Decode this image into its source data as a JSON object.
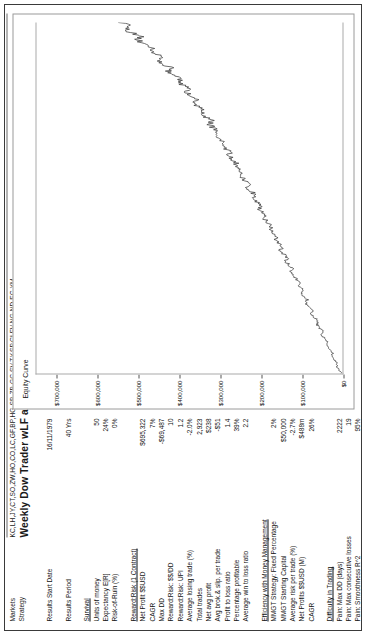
{
  "header": {
    "markets_label": "Markets",
    "markets_value": "KC,LH,JY,CT,SO,ZW,HO,CO,LC,GF,BP,HG,SB,ZB,GC,SV,TY,SP,CLFV,NG,ND,EC,YM",
    "strategy_label": "Strategy",
    "strategy_value": "Weekly Dow Trader wLF and Daily 2 Stop Trade Plan",
    "results_start_date_label": "Results Start Date",
    "results_start_date_value": "16/11/1979",
    "results_period_label": "Results Period",
    "results_period_value": "40 Yrs"
  },
  "metrics": {
    "sections": [
      {
        "title": "Survival",
        "rows": [
          {
            "label": "Units of money",
            "value": "50"
          },
          {
            "label": "Expectancy E[R]",
            "value": "24%"
          },
          {
            "label": "Risk-of-Ruin (%)",
            "value": "0%"
          }
        ]
      },
      {
        "title": "Reward:Risk (1 Contract)",
        "rows": [
          {
            "label": "Net Profit $$USD",
            "value": "$695,322"
          },
          {
            "label": "CAGR",
            "value": "7%"
          },
          {
            "label": "Max DD",
            "value": "-$69,487"
          },
          {
            "label": "Reward:Risk: $$/DD",
            "value": "10"
          },
          {
            "label": "Reward:Risk: UPI",
            "value": "1.2"
          },
          {
            "label": "Average losing trade (%)",
            "value": "-2.0%"
          },
          {
            "label": "Total trades",
            "value": "2,923"
          },
          {
            "label": "Net avg profit",
            "value": "$238"
          },
          {
            "label": "Avg brok.& slip. per trade",
            "value": "-$51"
          },
          {
            "label": "Profit to loss ratio",
            "value": "1.4"
          },
          {
            "label": "Percentage profitable",
            "value": "39%"
          },
          {
            "label": "Average win to loss ratio",
            "value": "2.2"
          }
        ]
      },
      {
        "title": "Efficiency with Money Management",
        "rows": [
          {
            "label": "MMGT Strategy: Fixed Percentage",
            "value": "2%"
          },
          {
            "label": "MMGT Starting Capital",
            "value": "$50,000"
          },
          {
            "label": "Average risk per trade (%)",
            "value": "-2.7%"
          },
          {
            "label": "Net Profits $$USD (M)",
            "value": "$488m"
          },
          {
            "label": "CAGR",
            "value": "26%"
          }
        ]
      },
      {
        "title": "Difficulty in Trading",
        "rows": [
          {
            "label": "Pain: Max DD (days)",
            "value": "2222"
          },
          {
            "label": "Pain: Max consecutive losses",
            "value": "19"
          },
          {
            "label": "Pain: Smoothness R^2",
            "value": "95%"
          }
        ]
      }
    ]
  },
  "chart_data": {
    "type": "line",
    "title": "Equity Curve",
    "xlabel": "",
    "ylabel": "",
    "grid": false,
    "legend": "none",
    "ylim": [
      0,
      750000
    ],
    "ytick_labels": [
      "$700,000",
      "$600,000",
      "$500,000",
      "$400,000",
      "$300,000",
      "$200,000",
      "$100,000",
      "$0"
    ],
    "ytick_values": [
      700000,
      600000,
      500000,
      400000,
      300000,
      200000,
      100000,
      0
    ],
    "series": [
      {
        "name": "Equity Curve",
        "x": [
          0,
          1,
          2,
          3,
          4,
          5,
          6,
          7,
          8,
          9,
          10,
          11,
          12,
          13,
          14,
          15,
          16,
          17,
          18,
          19,
          20,
          21,
          22,
          23,
          24,
          25,
          26,
          27,
          28,
          29,
          30,
          31,
          32,
          33,
          34,
          35,
          36,
          37,
          38,
          39,
          40,
          41,
          42,
          43,
          44,
          45,
          46,
          47,
          48,
          49,
          50,
          51,
          52,
          53,
          54,
          55,
          56,
          57,
          58,
          59,
          60,
          61,
          62,
          63,
          64,
          65,
          66,
          67,
          68,
          69,
          70,
          71,
          72,
          73,
          74,
          75,
          76,
          77,
          78,
          79,
          80,
          81,
          82,
          83,
          84,
          85,
          86,
          87,
          88,
          89,
          90,
          91,
          92,
          93,
          94,
          95,
          96,
          97,
          98,
          99,
          100
        ],
        "values": [
          2000,
          9000,
          14000,
          12000,
          20000,
          26000,
          24000,
          33000,
          39000,
          37000,
          44000,
          51000,
          48000,
          57000,
          63000,
          60000,
          69000,
          76000,
          73000,
          82000,
          89000,
          86000,
          95000,
          102000,
          99000,
          108000,
          104000,
          113000,
          121000,
          126000,
          122000,
          131000,
          139000,
          135000,
          144000,
          152000,
          148000,
          157000,
          165000,
          161000,
          170000,
          178000,
          174000,
          183000,
          191000,
          187000,
          197000,
          205000,
          201000,
          211000,
          219000,
          215000,
          225000,
          233000,
          229000,
          240000,
          248000,
          244000,
          255000,
          263000,
          259000,
          270000,
          279000,
          274000,
          286000,
          295000,
          289000,
          301000,
          311000,
          305000,
          317000,
          327000,
          321000,
          334000,
          344000,
          338000,
          352000,
          363000,
          356000,
          371000,
          383000,
          375000,
          391000,
          404000,
          396000,
          413000,
          427000,
          418000,
          436000,
          451000,
          441000,
          460000,
          476000,
          466000,
          486000,
          503000,
          492000,
          514000,
          533000,
          521000,
          546000
        ],
        "color": "#3d3d3d"
      }
    ]
  }
}
